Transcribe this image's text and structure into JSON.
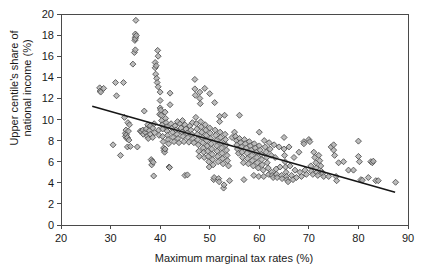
{
  "chart_data": {
    "type": "scatter",
    "title": "",
    "xlabel": "Maximum marginal tax rates (%)",
    "ylabel": "Upper centile's share of national income (%)",
    "ylabel_line1": "Upper centile's share of",
    "ylabel_line2": "national income (%)",
    "xlim": [
      20,
      90
    ],
    "ylim": [
      0,
      20
    ],
    "xticks": [
      20,
      30,
      40,
      50,
      60,
      70,
      80,
      90
    ],
    "yticks": [
      0,
      2,
      4,
      6,
      8,
      10,
      12,
      14,
      16,
      18,
      20
    ],
    "xtick_labels": [
      "20",
      "30",
      "40",
      "50",
      "60",
      "70",
      "80",
      "90"
    ],
    "ytick_labels": [
      "0",
      "2",
      "4",
      "6",
      "8",
      "10",
      "12",
      "14",
      "16",
      "18",
      "20"
    ],
    "grid": false,
    "legend": null,
    "marker": {
      "shape": "diamond",
      "fill_color": "#b0b0b0",
      "edge_color": "#4c4c4c",
      "size_px": 5.2
    },
    "trendline": {
      "type": "linear-fit",
      "color": "#161616",
      "x_start": 26.3,
      "y_start": 11.25,
      "x_end": 87.4,
      "y_end": 3.1
    },
    "points": [
      [
        27.8,
        13.0
      ],
      [
        27.9,
        12.7
      ],
      [
        28.0,
        12.6
      ],
      [
        28.6,
        12.95
      ],
      [
        30.5,
        7.6
      ],
      [
        31.0,
        13.5
      ],
      [
        31.2,
        12.25
      ],
      [
        32.0,
        6.6
      ],
      [
        32.6,
        13.5
      ],
      [
        32.8,
        10.2
      ],
      [
        33.0,
        8.7
      ],
      [
        33.0,
        8.4
      ],
      [
        33.1,
        9.0
      ],
      [
        33.2,
        8.55
      ],
      [
        33.3,
        8.2
      ],
      [
        33.4,
        8.3
      ],
      [
        33.4,
        7.4
      ],
      [
        33.5,
        9.7
      ],
      [
        33.6,
        8.9
      ],
      [
        33.7,
        8.05
      ],
      [
        33.8,
        9.5
      ],
      [
        34.0,
        7.45
      ],
      [
        34.5,
        15.25
      ],
      [
        34.8,
        16.35
      ],
      [
        34.9,
        17.5
      ],
      [
        35.0,
        17.8
      ],
      [
        35.0,
        18.1
      ],
      [
        35.0,
        17.65
      ],
      [
        35.0,
        16.6
      ],
      [
        35.1,
        19.4
      ],
      [
        35.2,
        17.95
      ],
      [
        35.4,
        7.4
      ],
      [
        36.0,
        8.9
      ],
      [
        36.2,
        8.85
      ],
      [
        36.5,
        9.0
      ],
      [
        36.6,
        8.6
      ],
      [
        36.8,
        10.8
      ],
      [
        37.0,
        8.8
      ],
      [
        37.2,
        9.1
      ],
      [
        37.4,
        8.4
      ],
      [
        37.5,
        9.5
      ],
      [
        37.6,
        8.2
      ],
      [
        37.8,
        8.95
      ],
      [
        38.0,
        9.4
      ],
      [
        38.0,
        8.6
      ],
      [
        38.2,
        6.2
      ],
      [
        38.3,
        5.7
      ],
      [
        38.4,
        6.05
      ],
      [
        38.5,
        9.2
      ],
      [
        38.5,
        8.3
      ],
      [
        38.6,
        5.95
      ],
      [
        38.7,
        4.65
      ],
      [
        38.8,
        9.6
      ],
      [
        38.9,
        8.75
      ],
      [
        39.0,
        15.4
      ],
      [
        39.0,
        14.9
      ],
      [
        39.1,
        14.3
      ],
      [
        39.2,
        15.1
      ],
      [
        39.3,
        13.9
      ],
      [
        39.4,
        13.5
      ],
      [
        39.5,
        16.55
      ],
      [
        39.6,
        16.0
      ],
      [
        39.6,
        13.1
      ],
      [
        39.7,
        9.0
      ],
      [
        39.8,
        8.5
      ],
      [
        39.9,
        10.5
      ],
      [
        40.0,
        12.6
      ],
      [
        40.0,
        11.8
      ],
      [
        40.0,
        11.1
      ],
      [
        40.1,
        10.9
      ],
      [
        40.2,
        10.4
      ],
      [
        40.3,
        9.9
      ],
      [
        40.4,
        9.5
      ],
      [
        40.5,
        9.1
      ],
      [
        40.5,
        8.4
      ],
      [
        40.6,
        7.9
      ],
      [
        40.7,
        7.3
      ],
      [
        40.8,
        7.05
      ],
      [
        40.9,
        6.9
      ],
      [
        41.0,
        7.2
      ],
      [
        41.0,
        10.7
      ],
      [
        41.1,
        10.1
      ],
      [
        41.2,
        9.7
      ],
      [
        41.3,
        9.3
      ],
      [
        41.4,
        8.9
      ],
      [
        41.5,
        8.5
      ],
      [
        41.6,
        8.1
      ],
      [
        41.7,
        7.7
      ],
      [
        41.8,
        5.5
      ],
      [
        41.9,
        5.45
      ],
      [
        42.0,
        12.5
      ],
      [
        42.0,
        11.4
      ],
      [
        42.2,
        9.6
      ],
      [
        42.4,
        9.2
      ],
      [
        42.5,
        8.8
      ],
      [
        42.6,
        8.3
      ],
      [
        42.8,
        7.9
      ],
      [
        43.0,
        9.4
      ],
      [
        43.2,
        9.0
      ],
      [
        43.4,
        8.6
      ],
      [
        43.5,
        9.8
      ],
      [
        43.6,
        8.2
      ],
      [
        43.8,
        7.8
      ],
      [
        44.0,
        9.6
      ],
      [
        44.2,
        9.2
      ],
      [
        44.4,
        8.8
      ],
      [
        44.5,
        9.9
      ],
      [
        44.6,
        8.4
      ],
      [
        44.8,
        7.9
      ],
      [
        45.0,
        9.5
      ],
      [
        45.0,
        4.7
      ],
      [
        45.2,
        9.1
      ],
      [
        45.4,
        8.7
      ],
      [
        45.5,
        4.75
      ],
      [
        45.6,
        8.3
      ],
      [
        45.8,
        7.85
      ],
      [
        46.0,
        9.4
      ],
      [
        46.2,
        9.0
      ],
      [
        46.4,
        8.6
      ],
      [
        46.5,
        9.7
      ],
      [
        46.6,
        8.2
      ],
      [
        46.8,
        7.8
      ],
      [
        47.0,
        13.8
      ],
      [
        47.0,
        12.9
      ],
      [
        47.1,
        12.3
      ],
      [
        47.2,
        10.2
      ],
      [
        47.3,
        9.6
      ],
      [
        47.4,
        9.1
      ],
      [
        47.5,
        8.6
      ],
      [
        47.6,
        8.1
      ],
      [
        47.7,
        7.6
      ],
      [
        47.8,
        7.0
      ],
      [
        47.9,
        6.5
      ],
      [
        48.0,
        12.6
      ],
      [
        48.0,
        12.0
      ],
      [
        48.1,
        11.5
      ],
      [
        48.2,
        9.8
      ],
      [
        48.3,
        9.3
      ],
      [
        48.4,
        8.8
      ],
      [
        48.5,
        8.3
      ],
      [
        48.6,
        7.8
      ],
      [
        48.7,
        7.3
      ],
      [
        48.8,
        6.9
      ],
      [
        48.9,
        6.4
      ],
      [
        49.0,
        12.95
      ],
      [
        49.1,
        9.5
      ],
      [
        49.2,
        9.0
      ],
      [
        49.3,
        8.5
      ],
      [
        49.4,
        8.0
      ],
      [
        49.5,
        7.5
      ],
      [
        49.6,
        7.0
      ],
      [
        49.7,
        6.5
      ],
      [
        49.8,
        6.0
      ],
      [
        49.9,
        5.5
      ],
      [
        50.0,
        12.45
      ],
      [
        50.0,
        9.2
      ],
      [
        50.1,
        8.7
      ],
      [
        50.2,
        8.2
      ],
      [
        50.3,
        7.7
      ],
      [
        50.4,
        7.2
      ],
      [
        50.5,
        6.7
      ],
      [
        50.6,
        6.2
      ],
      [
        50.7,
        5.7
      ],
      [
        50.8,
        4.3
      ],
      [
        50.9,
        4.5
      ],
      [
        51.0,
        11.6
      ],
      [
        51.1,
        9.0
      ],
      [
        51.2,
        8.5
      ],
      [
        51.3,
        8.0
      ],
      [
        51.4,
        7.5
      ],
      [
        51.5,
        7.0
      ],
      [
        51.6,
        6.5
      ],
      [
        51.7,
        6.0
      ],
      [
        51.8,
        4.4
      ],
      [
        51.9,
        4.1
      ],
      [
        52.0,
        10.3
      ],
      [
        52.0,
        9.8
      ],
      [
        52.1,
        8.8
      ],
      [
        52.2,
        8.3
      ],
      [
        52.3,
        7.8
      ],
      [
        52.4,
        7.3
      ],
      [
        52.5,
        6.8
      ],
      [
        52.6,
        6.3
      ],
      [
        52.7,
        5.8
      ],
      [
        52.8,
        3.5
      ],
      [
        52.9,
        3.8
      ],
      [
        53.0,
        10.4
      ],
      [
        53.1,
        8.6
      ],
      [
        53.2,
        8.1
      ],
      [
        53.3,
        7.6
      ],
      [
        53.4,
        7.1
      ],
      [
        53.5,
        6.6
      ],
      [
        53.6,
        6.1
      ],
      [
        53.8,
        5.6
      ],
      [
        54.0,
        4.2
      ],
      [
        54.5,
        8.3
      ],
      [
        55.0,
        8.8
      ],
      [
        55.2,
        8.4
      ],
      [
        55.4,
        8.0
      ],
      [
        55.5,
        7.6
      ],
      [
        55.6,
        7.2
      ],
      [
        55.8,
        6.8
      ],
      [
        56.0,
        10.4
      ],
      [
        56.0,
        8.2
      ],
      [
        56.2,
        7.8
      ],
      [
        56.4,
        7.4
      ],
      [
        56.5,
        6.9
      ],
      [
        56.6,
        6.4
      ],
      [
        56.8,
        5.9
      ],
      [
        56.9,
        4.3
      ],
      [
        57.0,
        8.1
      ],
      [
        57.2,
        7.7
      ],
      [
        57.4,
        7.3
      ],
      [
        57.5,
        6.8
      ],
      [
        57.6,
        6.3
      ],
      [
        57.8,
        5.8
      ],
      [
        58.0,
        7.9
      ],
      [
        58.2,
        7.5
      ],
      [
        58.4,
        7.1
      ],
      [
        58.5,
        6.6
      ],
      [
        58.6,
        6.1
      ],
      [
        58.8,
        5.6
      ],
      [
        58.9,
        4.7
      ],
      [
        59.0,
        7.7
      ],
      [
        59.2,
        7.3
      ],
      [
        59.4,
        6.9
      ],
      [
        59.5,
        6.4
      ],
      [
        59.6,
        5.9
      ],
      [
        59.8,
        5.4
      ],
      [
        59.9,
        4.6
      ],
      [
        60.0,
        8.8
      ],
      [
        60.0,
        7.5
      ],
      [
        60.2,
        7.1
      ],
      [
        60.4,
        6.7
      ],
      [
        60.5,
        6.2
      ],
      [
        60.6,
        5.7
      ],
      [
        60.8,
        5.2
      ],
      [
        60.9,
        4.6
      ],
      [
        61.0,
        8.0
      ],
      [
        61.2,
        7.4
      ],
      [
        61.4,
        6.9
      ],
      [
        61.5,
        6.4
      ],
      [
        61.6,
        5.9
      ],
      [
        61.8,
        5.4
      ],
      [
        61.9,
        4.8
      ],
      [
        62.0,
        7.8
      ],
      [
        62.2,
        7.2
      ],
      [
        62.4,
        6.6
      ],
      [
        62.5,
        5.0
      ],
      [
        62.6,
        4.7
      ],
      [
        62.8,
        4.5
      ],
      [
        63.0,
        7.6
      ],
      [
        63.2,
        6.4
      ],
      [
        63.4,
        5.3
      ],
      [
        63.5,
        4.8
      ],
      [
        63.6,
        4.5
      ],
      [
        64.0,
        7.4
      ],
      [
        64.2,
        5.5
      ],
      [
        64.5,
        4.7
      ],
      [
        64.6,
        4.4
      ],
      [
        65.0,
        8.3
      ],
      [
        65.0,
        7.2
      ],
      [
        65.1,
        6.6
      ],
      [
        65.2,
        6.0
      ],
      [
        65.3,
        5.5
      ],
      [
        65.4,
        5.0
      ],
      [
        65.5,
        4.6
      ],
      [
        65.6,
        4.3
      ],
      [
        65.8,
        4.1
      ],
      [
        66.0,
        7.4
      ],
      [
        66.2,
        5.6
      ],
      [
        66.5,
        4.7
      ],
      [
        66.8,
        4.3
      ],
      [
        67.0,
        6.4
      ],
      [
        67.2,
        5.2
      ],
      [
        67.5,
        4.5
      ],
      [
        68.0,
        6.9
      ],
      [
        68.2,
        5.0
      ],
      [
        68.5,
        4.6
      ],
      [
        69.0,
        7.9
      ],
      [
        69.0,
        7.7
      ],
      [
        69.2,
        5.2
      ],
      [
        69.5,
        4.8
      ],
      [
        70.0,
        8.1
      ],
      [
        70.2,
        7.9
      ],
      [
        70.4,
        5.6
      ],
      [
        70.5,
        5.1
      ],
      [
        70.8,
        4.8
      ],
      [
        71.0,
        6.9
      ],
      [
        71.2,
        6.4
      ],
      [
        71.4,
        5.9
      ],
      [
        71.5,
        5.4
      ],
      [
        71.6,
        5.0
      ],
      [
        71.8,
        4.7
      ],
      [
        72.0,
        6.6
      ],
      [
        72.2,
        6.1
      ],
      [
        72.4,
        5.6
      ],
      [
        72.5,
        5.1
      ],
      [
        72.8,
        4.9
      ],
      [
        73.0,
        4.6
      ],
      [
        74.0,
        4.6
      ],
      [
        74.5,
        7.4
      ],
      [
        75.0,
        7.6
      ],
      [
        75.0,
        7.1
      ],
      [
        75.2,
        6.6
      ],
      [
        75.5,
        4.6
      ],
      [
        75.6,
        4.2
      ],
      [
        76.0,
        5.9
      ],
      [
        77.0,
        6.0
      ],
      [
        78.0,
        5.2
      ],
      [
        79.0,
        5.2
      ],
      [
        80.0,
        7.95
      ],
      [
        80.0,
        6.5
      ],
      [
        80.2,
        6.0
      ],
      [
        80.5,
        4.3
      ],
      [
        80.8,
        4.25
      ],
      [
        82.0,
        4.5
      ],
      [
        82.5,
        6.0
      ],
      [
        82.8,
        5.9
      ],
      [
        83.0,
        6.05
      ],
      [
        83.5,
        4.2
      ],
      [
        84.0,
        4.2
      ],
      [
        87.5,
        4.05
      ]
    ]
  },
  "axes_geometry": {
    "left_px": 61,
    "right_px": 408,
    "top_px": 14,
    "bottom_px": 225
  }
}
